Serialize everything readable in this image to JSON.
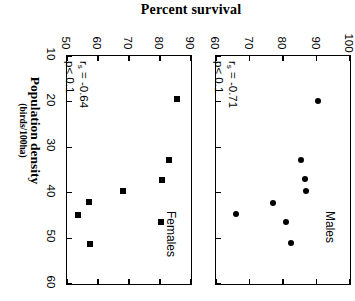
{
  "figure": {
    "title": "Percent survival",
    "y_axis_label": "Population density",
    "y_axis_units": "(birds/100ha)",
    "orientation": "rotated-90-ccw"
  },
  "chart_data": [
    {
      "type": "scatter",
      "title": "Females",
      "panel_label": "Females",
      "xlabel": "Population density (birds/100ha)",
      "ylabel": "Percent survival",
      "xlim": [
        10,
        60
      ],
      "ylim": [
        50,
        90
      ],
      "xticks": [
        10,
        20,
        30,
        40,
        50,
        60
      ],
      "yticks": [
        50,
        60,
        70,
        80,
        90
      ],
      "marker": "square",
      "grid": false,
      "annotation_r": "r  = -0.64",
      "annotation_r_sub": "s",
      "annotation_p": "p< 0.1",
      "points": [
        {
          "density": 19.5,
          "survival": 85.5
        },
        {
          "density": 32.8,
          "survival": 83.0
        },
        {
          "density": 37.2,
          "survival": 80.8
        },
        {
          "density": 39.7,
          "survival": 68.0
        },
        {
          "density": 42.0,
          "survival": 57.0
        },
        {
          "density": 44.8,
          "survival": 53.5
        },
        {
          "density": 46.5,
          "survival": 80.3
        },
        {
          "density": 51.2,
          "survival": 57.5
        }
      ]
    },
    {
      "type": "scatter",
      "title": "Males",
      "panel_label": "Males",
      "xlabel": "Population density (birds/100ha)",
      "ylabel": "Percent survival",
      "xlim": [
        10,
        60
      ],
      "ylim": [
        60,
        100
      ],
      "xticks": [
        10,
        20,
        30,
        40,
        50,
        60
      ],
      "yticks": [
        60,
        70,
        80,
        90,
        100
      ],
      "marker": "circle",
      "grid": false,
      "annotation_r": "r  = -0.71",
      "annotation_r_sub": "s",
      "annotation_p": "p< 0.1",
      "points": [
        {
          "density": 19.8,
          "survival": 90.5
        },
        {
          "density": 32.8,
          "survival": 85.5
        },
        {
          "density": 37.0,
          "survival": 86.5
        },
        {
          "density": 39.5,
          "survival": 87.0
        },
        {
          "density": 42.2,
          "survival": 77.0
        },
        {
          "density": 44.6,
          "survival": 66.0
        },
        {
          "density": 46.3,
          "survival": 81.0
        },
        {
          "density": 51.0,
          "survival": 82.5
        }
      ]
    }
  ]
}
